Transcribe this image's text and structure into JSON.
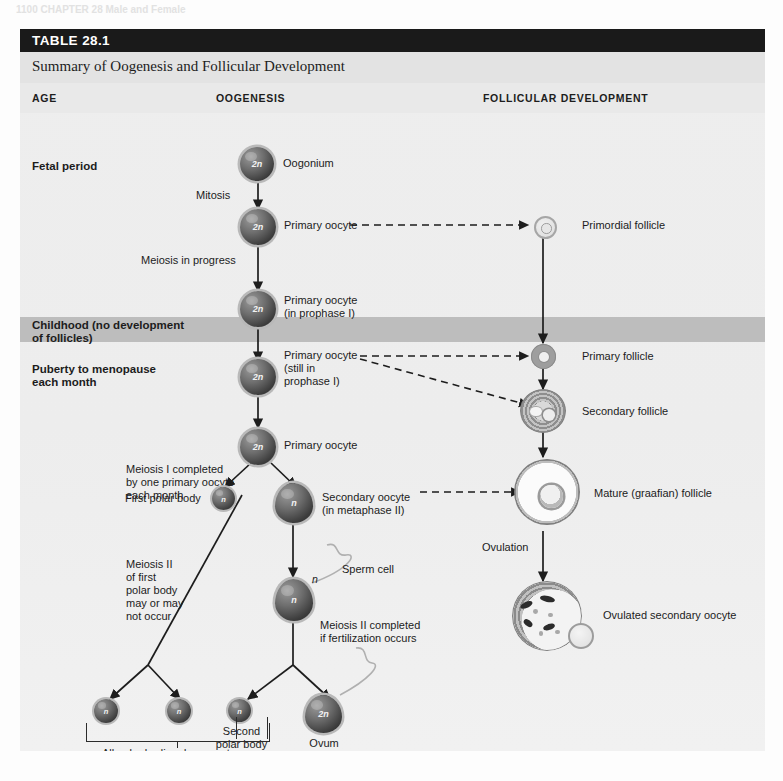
{
  "page": {
    "running_head": "1100  CHAPTER 28     Male and Female"
  },
  "table": {
    "number_label": "TABLE 28.1",
    "title": "Summary of Oogenesis and Follicular Development",
    "columns": {
      "age": "AGE",
      "oogenesis": "OOGENESIS",
      "follicular": "FOLLICULAR DEVELOPMENT"
    }
  },
  "age_stages": [
    {
      "id": "fetal",
      "label": "Fetal period"
    },
    {
      "id": "childhood",
      "label": "Childhood (no development\nof follicles)"
    },
    {
      "id": "puberty",
      "label": "Puberty to menopause\neach month"
    }
  ],
  "oogenesis": {
    "cells": [
      {
        "id": "oogonium",
        "ploidy": "2n",
        "label": "Oogonium"
      },
      {
        "id": "primary-oocyte-1",
        "ploidy": "2n",
        "label": "Primary oocyte"
      },
      {
        "id": "primary-oocyte-2",
        "ploidy": "2n",
        "label": "Primary oocyte\n(in prophase I)"
      },
      {
        "id": "primary-oocyte-3",
        "ploidy": "2n",
        "label": "Primary oocyte\n(still in\nprophase I)"
      },
      {
        "id": "primary-oocyte-4",
        "ploidy": "2n",
        "label": "Primary oocyte"
      },
      {
        "id": "first-polar-body",
        "ploidy": "n",
        "label": "First polar body"
      },
      {
        "id": "secondary-oocyte",
        "ploidy": "n",
        "label": "Secondary oocyte\n(in metaphase II)"
      },
      {
        "id": "fertilized-oocyte",
        "ploidy": "n",
        "label": "Sperm cell"
      },
      {
        "id": "polar-body-a",
        "ploidy": "n",
        "label": ""
      },
      {
        "id": "polar-body-b",
        "ploidy": "n",
        "label": ""
      },
      {
        "id": "second-polar-body",
        "ploidy": "n",
        "label": "Second\npolar body"
      },
      {
        "id": "ovum",
        "ploidy": "2n",
        "label": "Ovum"
      }
    ],
    "process_labels": [
      {
        "id": "mitosis",
        "text": "Mitosis"
      },
      {
        "id": "meiosis-in-progress",
        "text": "Meiosis in progress"
      },
      {
        "id": "meiosis-i-completed",
        "text": "Meiosis I completed\nby one primary oocyte\neach month"
      },
      {
        "id": "meiosis-ii-polar-body",
        "text": "Meiosis II\nof first\npolar body\nmay or may\nnot occur"
      },
      {
        "id": "meiosis-ii-completed",
        "text": "Meiosis II completed\nif fertilization occurs"
      },
      {
        "id": "sperm-cell",
        "text": "Sperm cell"
      },
      {
        "id": "sperm-ploidy",
        "text": "n"
      }
    ],
    "bracket_note": "All polar bodies degenerate"
  },
  "follicular": {
    "stages": [
      {
        "id": "primordial-follicle",
        "label": "Primordial follicle"
      },
      {
        "id": "primary-follicle",
        "label": "Primary follicle"
      },
      {
        "id": "secondary-follicle",
        "label": "Secondary follicle"
      },
      {
        "id": "mature-follicle",
        "label": "Mature (graafian) follicle"
      },
      {
        "id": "ovulated-oocyte",
        "label": "Ovulated secondary oocyte"
      }
    ],
    "process_labels": [
      {
        "id": "ovulation",
        "text": "Ovulation"
      }
    ]
  },
  "colors": {
    "header_bar": "#1a1a1a",
    "header_text": "#ffffff",
    "table_body": "#ededed",
    "childhood_band": "#bdbdbd",
    "ink": "#1c1c1c"
  },
  "bleed_text": {
    "left_top": "that a mature follicle will rupture and\nrelease an oocyte. This event, called\novulation, usually occurs about 14 days\nbefore the next menstrual period begins.",
    "left_mid": "In the ovarian cycle the cyclic changes\nin the ovary are controlled by hormones\nfrom the anterior pituitary gland and the\novaries themselves.",
    "right_top": "meiosis and produce one haploid ovum\nand three polar bodies. The unequal\ncytoplasmic division ensures that the\novum has enough cytoplasm to support\nthe developing embryo.",
    "right_mid": "primary oocytes that are present at birth\nremain in prophase I until puberty, when\none each month resumes meiosis."
  }
}
